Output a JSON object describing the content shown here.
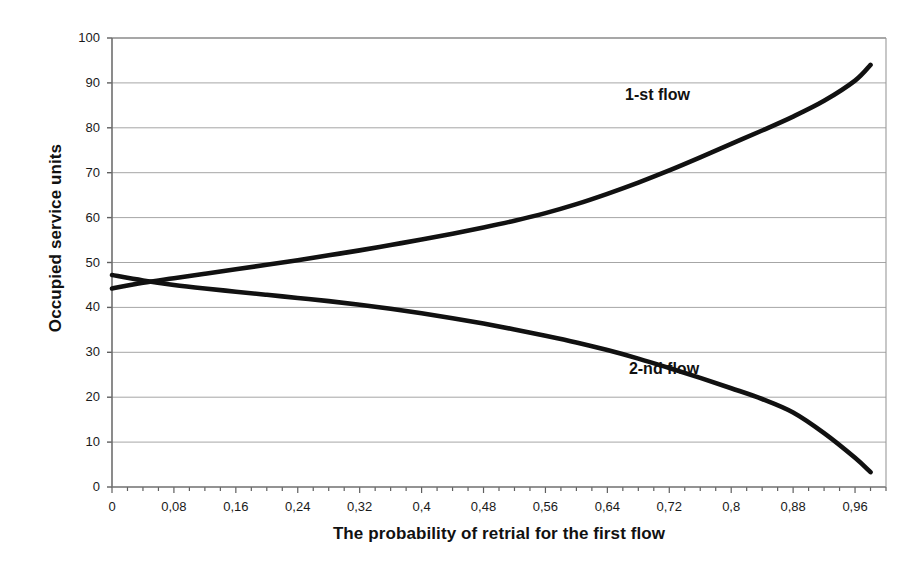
{
  "chart_data": {
    "type": "line",
    "title": "",
    "xlabel": "The probability of retrial for the first flow",
    "ylabel": "Occupied service units",
    "xlim": [
      0,
      1
    ],
    "ylim": [
      0,
      100
    ],
    "grid": true,
    "legend_position": "inline-annotation",
    "xticks": [
      "0",
      "0,08",
      "0,16",
      "0,24",
      "0,32",
      "0,4",
      "0,48",
      "0,56",
      "0,64",
      "0,72",
      "0,8",
      "0,88",
      "0,96"
    ],
    "xtick_values": [
      0,
      0.08,
      0.16,
      0.24,
      0.32,
      0.4,
      0.48,
      0.56,
      0.64,
      0.72,
      0.8,
      0.88,
      0.96
    ],
    "xtick_minor_step": 0.02,
    "yticks": [
      "0",
      "10",
      "20",
      "30",
      "40",
      "50",
      "60",
      "70",
      "80",
      "90",
      "100"
    ],
    "ytick_values": [
      0,
      10,
      20,
      30,
      40,
      50,
      60,
      70,
      80,
      90,
      100
    ],
    "x": [
      0,
      0.04,
      0.08,
      0.12,
      0.16,
      0.2,
      0.24,
      0.28,
      0.32,
      0.36,
      0.4,
      0.44,
      0.48,
      0.52,
      0.56,
      0.6,
      0.64,
      0.68,
      0.72,
      0.76,
      0.8,
      0.84,
      0.88,
      0.92,
      0.96,
      0.98
    ],
    "series": [
      {
        "name": "1-st flow",
        "color": "#111111",
        "label_x": 0.73,
        "label_y": 87,
        "values": [
          44.2,
          45.5,
          46.5,
          47.5,
          48.5,
          49.5,
          50.5,
          51.6,
          52.7,
          53.9,
          55.1,
          56.4,
          57.8,
          59.3,
          61.0,
          63.0,
          65.3,
          67.8,
          70.5,
          73.4,
          76.4,
          79.4,
          82.5,
          86.0,
          90.5,
          94.0
        ]
      },
      {
        "name": "2-nd flow",
        "color": "#111111",
        "label_x": 0.735,
        "label_y": 26,
        "values": [
          47.2,
          46.0,
          45.0,
          44.2,
          43.5,
          42.8,
          42.1,
          41.4,
          40.6,
          39.7,
          38.7,
          37.6,
          36.4,
          35.1,
          33.7,
          32.2,
          30.5,
          28.6,
          26.5,
          24.3,
          22.0,
          19.6,
          16.6,
          12.0,
          6.5,
          3.3
        ]
      }
    ]
  },
  "axis": {
    "x_title": "The probability of retrial for the first flow",
    "y_title": "Occupied service units"
  }
}
